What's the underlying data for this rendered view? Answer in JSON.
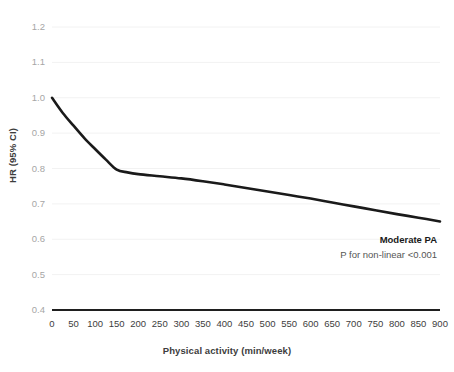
{
  "chart_data": {
    "type": "line",
    "title": "",
    "xlabel": "Physical activity (min/week)",
    "ylabel": "HR (95% CI)",
    "xlim": [
      0,
      900
    ],
    "ylim": [
      0.4,
      1.2
    ],
    "grid": true,
    "legend_position": "none",
    "xticks": [
      0,
      50,
      100,
      150,
      200,
      250,
      300,
      350,
      400,
      450,
      500,
      550,
      600,
      650,
      700,
      750,
      800,
      850,
      900
    ],
    "xtick_labels": [
      "0",
      "50",
      "100",
      "150",
      "200",
      "250",
      "300",
      "350",
      "400",
      "450",
      "500",
      "550",
      "600",
      "650",
      "700",
      "750",
      "800",
      "850",
      "900"
    ],
    "yticks": [
      0.4,
      0.5,
      0.6,
      0.7,
      0.8,
      0.9,
      1.0,
      1.1,
      1.2
    ],
    "ytick_labels": [
      "0.4",
      "0.5",
      "0.6",
      "0.7",
      "0.8",
      "0.9",
      "1.0",
      "1.1",
      "1.2"
    ],
    "series": [
      {
        "name": "Moderate PA",
        "color": "#1a1a1a",
        "x": [
          0,
          25,
          50,
          75,
          100,
          125,
          150,
          175,
          200,
          250,
          300,
          350,
          400,
          450,
          500,
          550,
          600,
          650,
          700,
          750,
          800,
          850,
          900
        ],
        "values": [
          1.0,
          0.957,
          0.921,
          0.886,
          0.855,
          0.825,
          0.797,
          0.789,
          0.784,
          0.778,
          0.772,
          0.764,
          0.755,
          0.745,
          0.735,
          0.725,
          0.715,
          0.704,
          0.693,
          0.682,
          0.671,
          0.661,
          0.65
        ]
      }
    ],
    "annotations": [
      {
        "name": "series-label",
        "text": "Moderate PA",
        "bold": true
      },
      {
        "name": "p-value",
        "text": "P for non-linear <0.001",
        "bold": false
      }
    ],
    "reference_line": {
      "y": 1.0,
      "description": "null hazard ratio"
    }
  },
  "axes": {
    "x_title": "Physical activity (min/week)",
    "y_title": "HR (95% CI)"
  },
  "annotations": {
    "series_label": "Moderate PA",
    "p_value": "P for non-linear <0.001"
  },
  "colors": {
    "curve": "#1a1a1a",
    "grid": "#f2f2f2",
    "axis_line": "#1f1f1f",
    "tick_text": "#a6a6a6",
    "xtick_text": "#3d3d3d",
    "background": "#ffffff"
  }
}
